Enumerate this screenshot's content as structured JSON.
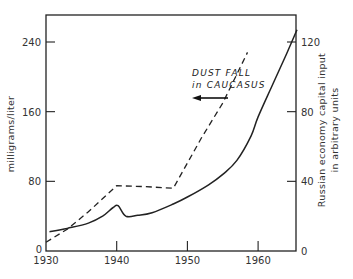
{
  "chart_data": {
    "type": "line",
    "title": "",
    "xlabel": "",
    "ylabel": "milligrams/liter",
    "y2label_line1": "Russian economy capital input",
    "y2label_line2": "in arbitrary units",
    "xlim": [
      1930,
      1965.5
    ],
    "ylim": [
      0,
      270
    ],
    "y2lim": [
      0,
      135
    ],
    "x_ticks": [
      1930,
      1940,
      1950,
      1960
    ],
    "x_tick_labels": [
      "1930",
      "1940",
      "1950",
      "1960"
    ],
    "y_ticks": [
      0,
      80,
      160,
      240
    ],
    "y_tick_labels": [
      "0",
      "80",
      "160",
      "240"
    ],
    "y2_ticks": [
      0,
      40,
      80,
      120
    ],
    "y2_tick_labels": [
      "0",
      "40",
      "80",
      "120"
    ],
    "grid": false,
    "legend": null,
    "annotations": [
      {
        "text_line1": "DUST FALL",
        "text_line2": "in CAUCASUS",
        "arrow": "left",
        "refers_to": "Dust fall in Caucasus"
      }
    ],
    "series": [
      {
        "name": "Dust fall in Caucasus",
        "axis": "left",
        "style": "dashed",
        "x": [
          1930,
          1933,
          1936,
          1940,
          1944,
          1948,
          1952,
          1955,
          1958.5
        ],
        "y": [
          10,
          25,
          45,
          75,
          74,
          72,
          130,
          170,
          228
        ]
      },
      {
        "name": "Russian economy capital input",
        "axis": "right",
        "style": "solid",
        "x": [
          1930.5,
          1933,
          1936,
          1938,
          1939.5,
          1940.2,
          1941.3,
          1943,
          1945,
          1948,
          1950,
          1953,
          1955,
          1957,
          1959,
          1960,
          1962,
          1964,
          1965.5
        ],
        "y": [
          11,
          13,
          16,
          20,
          25,
          26,
          20,
          20.5,
          22,
          27,
          31,
          38,
          44,
          52,
          66,
          77,
          95,
          113,
          127
        ]
      }
    ]
  }
}
